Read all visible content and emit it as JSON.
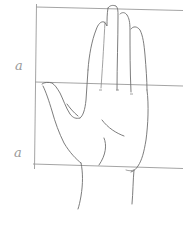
{
  "drawing": {
    "subject": "hand proportion sketch",
    "medium": "pencil",
    "labels": {
      "upper_segment": "a",
      "lower_segment": "a"
    },
    "colors": {
      "background": "#ffffff",
      "pencil_line": "#6e6e6e",
      "guide_line": "#9a9a9a"
    }
  }
}
